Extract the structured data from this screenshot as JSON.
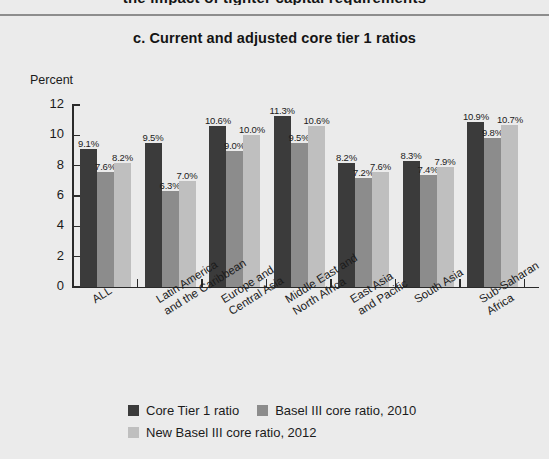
{
  "figure": {
    "clipped_header_text": "the impact of tighter capital requirements",
    "title": "c.  Current and adjusted core tier 1 ratios",
    "y_axis_unit": "Percent"
  },
  "chart_data": {
    "type": "bar",
    "title": "c.  Current and adjusted core tier 1 ratios",
    "xlabel": "",
    "ylabel": "Percent",
    "ylim": [
      0,
      12
    ],
    "yticks": [
      0,
      2,
      4,
      6,
      8,
      10,
      12
    ],
    "ytick_labels": [
      "0",
      "2",
      "4",
      "6",
      "8",
      "10",
      "12"
    ],
    "grid": false,
    "legend_position": "bottom-center",
    "value_label_suffix": "%",
    "categories": [
      "ALL",
      "Latin America\nand the Caribbean",
      "Europe and\nCentral Asia",
      "Middle East and\nNorth Africa",
      "East Asia\nand Pacific",
      "South Asia",
      "Sub-Saharan\nAfrica"
    ],
    "category_labels_flat": [
      "ALL",
      "Latin America and the Caribbean",
      "Europe and Central Asia",
      "Middle East and North Africa",
      "East Asia and Pacific",
      "South Asia",
      "Sub-Saharan Africa"
    ],
    "series": [
      {
        "name": "Core Tier 1 ratio",
        "color": "#3b3b3b",
        "values": [
          9.1,
          9.5,
          10.6,
          11.3,
          8.2,
          8.3,
          10.9
        ],
        "labels": [
          "9.1%",
          "9.5%",
          "10.6%",
          "11.3%",
          "8.2%",
          "8.3%",
          "10.9%"
        ]
      },
      {
        "name": "Basel III core ratio, 2010",
        "color": "#8c8c8c",
        "values": [
          7.6,
          6.3,
          9.0,
          9.5,
          7.2,
          7.4,
          9.8
        ],
        "labels": [
          "7.6%",
          "6.3%",
          "9.0%",
          "9.5%",
          "7.2%",
          "7.4%",
          "9.8%"
        ]
      },
      {
        "name": "New Basel III core ratio, 2012",
        "color": "#bfbfbf",
        "values": [
          8.2,
          7.0,
          10.0,
          10.6,
          7.6,
          7.9,
          10.7
        ],
        "labels": [
          "8.2%",
          "7.0%",
          "10.0%",
          "10.6%",
          "7.6%",
          "7.9%",
          "10.7%"
        ]
      }
    ]
  },
  "legend": {
    "rows": [
      [
        {
          "label": "Core Tier 1 ratio",
          "color": "#3b3b3b"
        },
        {
          "label": "Basel III core ratio, 2010",
          "color": "#8c8c8c"
        }
      ],
      [
        {
          "label": "New Basel III core ratio, 2012",
          "color": "#bfbfbf"
        }
      ]
    ]
  },
  "colors": {
    "background": "#ebebeb",
    "axis": "#2a2a2a",
    "rule": "#8d8d8d",
    "text": "#1b1b1b"
  }
}
